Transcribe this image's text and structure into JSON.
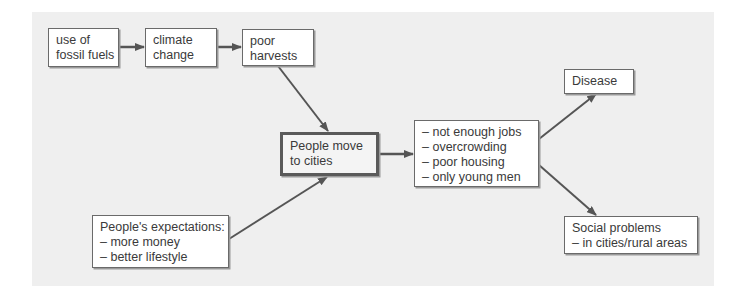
{
  "diagram": {
    "type": "flowchart",
    "nodes": {
      "fossil": {
        "lines": [
          "use of",
          "fossil fuels"
        ]
      },
      "climate": {
        "lines": [
          "climate",
          "change"
        ]
      },
      "harvests": {
        "lines": [
          "poor",
          "harvests"
        ]
      },
      "move": {
        "lines": [
          "People move",
          "to cities"
        ]
      },
      "expectations": {
        "lines": [
          "People's expectations:",
          "–  more money",
          "–  better lifestyle"
        ]
      },
      "problems": {
        "lines": [
          "–  not enough jobs",
          "–  overcrowding",
          "–  poor housing",
          "–  only young men"
        ]
      },
      "disease": {
        "lines": [
          "Disease"
        ]
      },
      "social": {
        "lines": [
          "Social problems",
          "–  in cities/rural areas"
        ]
      }
    },
    "edges": [
      {
        "from": "fossil",
        "to": "climate"
      },
      {
        "from": "climate",
        "to": "harvests"
      },
      {
        "from": "harvests",
        "to": "move"
      },
      {
        "from": "expectations",
        "to": "move"
      },
      {
        "from": "move",
        "to": "problems"
      },
      {
        "from": "problems",
        "to": "disease"
      },
      {
        "from": "problems",
        "to": "social"
      }
    ],
    "colors": {
      "background_panel": "#efefef",
      "box_fill": "#ffffff",
      "box_border": "#6a6a6a",
      "arrow": "#555555",
      "text": "#3a3a3a"
    }
  }
}
